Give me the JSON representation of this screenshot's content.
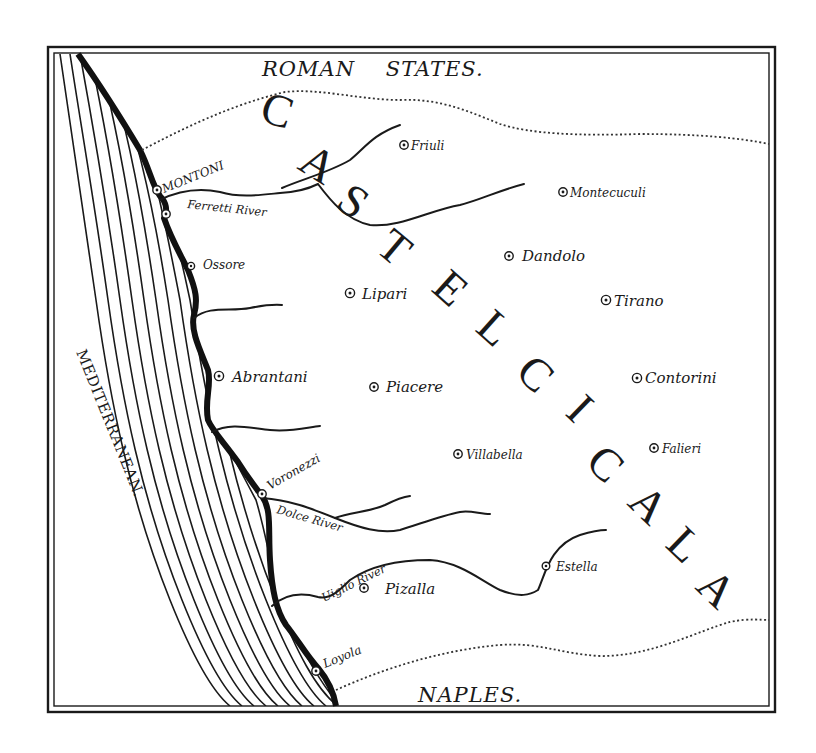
{
  "map": {
    "colors": {
      "ink": "#1a1a1a",
      "paper": "#ffffff"
    },
    "regions": {
      "north": "ROMAN    STATES.",
      "south": "NAPLES.",
      "sea": "MEDITERRANEAN."
    },
    "country": {
      "name": "CASTELCICALA",
      "letters": [
        "C",
        "A",
        "S",
        "T",
        "E",
        "L",
        "C",
        "I",
        "C",
        "A",
        "L",
        "A"
      ]
    },
    "towns": [
      {
        "name": "Friuli"
      },
      {
        "name": "MONTONI"
      },
      {
        "name": "Montecuculi"
      },
      {
        "name": "Ossore"
      },
      {
        "name": "Dandolo"
      },
      {
        "name": "Lipari"
      },
      {
        "name": "Tirano"
      },
      {
        "name": "Abrantani"
      },
      {
        "name": "Piacere"
      },
      {
        "name": "Contorini"
      },
      {
        "name": "Villabella"
      },
      {
        "name": "Falieri"
      },
      {
        "name": "Voronezzi"
      },
      {
        "name": "Estella"
      },
      {
        "name": "Pizalla"
      },
      {
        "name": "Loyola"
      }
    ],
    "rivers": [
      {
        "name": "Ferretti River"
      },
      {
        "name": "Dolce River"
      },
      {
        "name": "Uiglio River"
      }
    ]
  }
}
